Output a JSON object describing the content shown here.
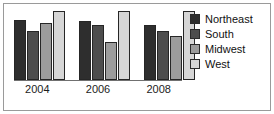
{
  "figure": {
    "border_color": "#9a9a9a",
    "background": "#ffffff"
  },
  "chart_data": {
    "type": "bar",
    "title": "",
    "subtitle": "",
    "xlabel": "",
    "ylabel": "",
    "grid": false,
    "legend_position": "right",
    "categories": [
      "2004",
      "2006",
      "2008"
    ],
    "ylim": [
      0,
      70
    ],
    "series": [
      {
        "name": "Northeast",
        "color": "#2e2e2e",
        "values": [
          58,
          57,
          53
        ]
      },
      {
        "name": "South",
        "color": "#4d4d4d",
        "values": [
          48,
          53,
          48
        ]
      },
      {
        "name": "Midwest",
        "color": "#9c9c9c",
        "values": [
          55,
          37,
          43
        ]
      },
      {
        "name": "West",
        "color": "#d6d6d6",
        "values": [
          67,
          67,
          67
        ]
      }
    ]
  },
  "axis": {
    "tick_labels": [
      "2004",
      "2006",
      "2008"
    ],
    "line_color": "#707070"
  },
  "legend": {
    "items": [
      {
        "label": "Northeast",
        "color": "#2e2e2e"
      },
      {
        "label": "South",
        "color": "#4d4d4d"
      },
      {
        "label": "Midwest",
        "color": "#9c9c9c"
      },
      {
        "label": "West",
        "color": "#d6d6d6"
      }
    ]
  }
}
